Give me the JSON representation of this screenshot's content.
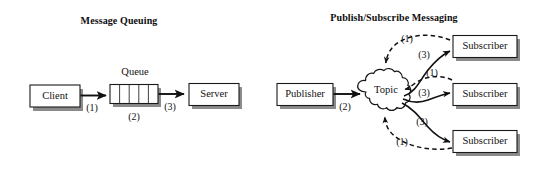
{
  "figure": {
    "type": "diagram",
    "panels": [
      {
        "id": "message-queuing",
        "title": "Message Queuing",
        "nodes": [
          {
            "id": "client",
            "label": "Client",
            "shape": "box"
          },
          {
            "id": "queue",
            "label": "Queue",
            "shape": "queue",
            "cells": 5
          },
          {
            "id": "server",
            "label": "Server",
            "shape": "box"
          }
        ],
        "edges": [
          {
            "id": "client-to-queue",
            "from": "client",
            "to": "queue",
            "label": "(1)",
            "style": "solid"
          },
          {
            "id": "queue-hold",
            "from": "queue",
            "to": "queue",
            "label": "(2)",
            "style": "none"
          },
          {
            "id": "queue-to-server",
            "from": "queue",
            "to": "server",
            "label": "(3)",
            "style": "solid"
          }
        ]
      },
      {
        "id": "publish-subscribe-messaging",
        "title": "Publish/Subscribe Messaging",
        "nodes": [
          {
            "id": "publisher",
            "label": "Publisher",
            "shape": "box"
          },
          {
            "id": "topic",
            "label": "Topic",
            "shape": "cloud"
          },
          {
            "id": "subscriber-top",
            "label": "Subscriber",
            "shape": "box"
          },
          {
            "id": "subscriber-middle",
            "label": "Subscriber",
            "shape": "box"
          },
          {
            "id": "subscriber-bottom",
            "label": "Subscriber",
            "shape": "box"
          }
        ],
        "edges": [
          {
            "id": "publisher-to-topic",
            "from": "publisher",
            "to": "topic",
            "label": "(2)",
            "style": "solid"
          },
          {
            "id": "subscriber-top-to-topic",
            "from": "subscriber-top",
            "to": "topic",
            "label": "(1)",
            "style": "dashed"
          },
          {
            "id": "topic-to-subscriber-top",
            "from": "topic",
            "to": "subscriber-top",
            "label": "(3)",
            "style": "solid"
          },
          {
            "id": "subscriber-middle-to-topic",
            "from": "subscriber-middle",
            "to": "topic",
            "label": "(1)",
            "style": "dashed"
          },
          {
            "id": "topic-to-subscriber-middle",
            "from": "topic",
            "to": "subscriber-middle",
            "label": "(3)",
            "style": "solid"
          },
          {
            "id": "subscriber-bottom-to-topic",
            "from": "subscriber-bottom",
            "to": "topic",
            "label": "(1)",
            "style": "dashed"
          },
          {
            "id": "topic-to-subscriber-bottom",
            "from": "topic",
            "to": "subscriber-bottom",
            "label": "(3)",
            "style": "solid"
          }
        ]
      }
    ]
  },
  "colors": {
    "background": "#ffffff",
    "ink": "#111111",
    "shadow": "#5e5e5e"
  }
}
